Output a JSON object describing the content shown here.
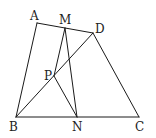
{
  "diagram": {
    "type": "geometry",
    "points": {
      "A": {
        "x": 37,
        "y": 23,
        "label": "A",
        "lx": 30,
        "ly": 20
      },
      "M": {
        "x": 65,
        "y": 28,
        "label": "M",
        "lx": 59,
        "ly": 24
      },
      "D": {
        "x": 93,
        "y": 33,
        "label": "D",
        "lx": 95,
        "ly": 33
      },
      "P": {
        "x": 54,
        "y": 76,
        "label": "P",
        "lx": 44,
        "ly": 80
      },
      "B": {
        "x": 16,
        "y": 117,
        "label": "B",
        "lx": 9,
        "ly": 131
      },
      "N": {
        "x": 77,
        "y": 117,
        "label": "N",
        "lx": 72,
        "ly": 131
      },
      "C": {
        "x": 139,
        "y": 117,
        "label": "C",
        "lx": 135,
        "ly": 131
      }
    },
    "segments": [
      [
        "A",
        "D"
      ],
      [
        "A",
        "B"
      ],
      [
        "B",
        "C"
      ],
      [
        "D",
        "C"
      ],
      [
        "B",
        "D"
      ],
      [
        "M",
        "P"
      ],
      [
        "M",
        "N"
      ],
      [
        "P",
        "N"
      ]
    ]
  }
}
